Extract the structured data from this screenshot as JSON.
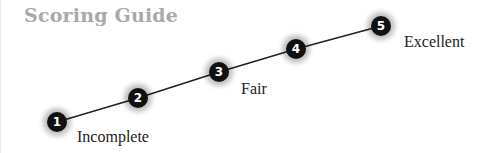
{
  "title": "Scoring Guide",
  "levels": [
    {
      "number": "1",
      "label": "Incomplete"
    },
    {
      "number": "2",
      "label": ""
    },
    {
      "number": "3",
      "label": "Fair"
    },
    {
      "number": "4",
      "label": ""
    },
    {
      "number": "5",
      "label": "Excellent"
    }
  ],
  "colors": {
    "node": "#111111",
    "line": "#222222",
    "title": "#a9a9a9"
  }
}
